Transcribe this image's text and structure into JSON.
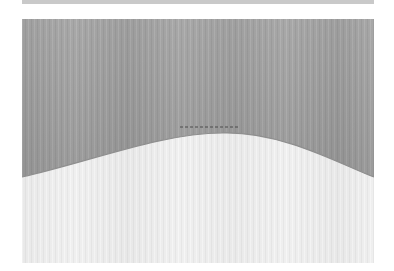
{
  "image": {
    "subject": "fabric swatch with curved edge",
    "description": "Grayscale photograph of a darker woven fabric over a lighter fabric, separated by a wave-shaped curved edge with a short dashed stitch line near the crest.",
    "colors": {
      "dark_fabric": "#a9a9a9",
      "dark_fabric_shadow": "#9a9a9a",
      "light_fabric": "#efefef",
      "light_fabric_shade": "#e3e3e3",
      "stitch": "#4a4a4a",
      "top_strip": "#c9c9c9",
      "background": "#ffffff"
    },
    "panel": {
      "x": 22,
      "y": 19,
      "width": 352,
      "height": 244
    },
    "curve": {
      "left_edge_y": 175,
      "peak_x": 210,
      "peak_y": 135,
      "right_edge_y": 175
    },
    "stitch_line": {
      "x1": 180,
      "x2": 240,
      "y": 127
    }
  }
}
